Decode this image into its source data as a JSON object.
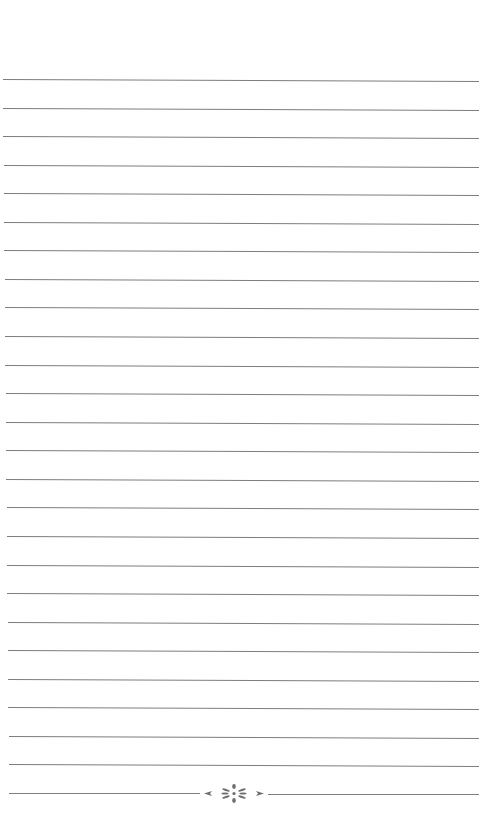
{
  "page": {
    "type": "lined-notebook-page",
    "background_color": "#ffffff",
    "line_color": "#7d7d7d",
    "line_count": 26,
    "first_line_y": 79,
    "line_spacing": 28.56,
    "line_left_top": 3,
    "line_left_bottom": 9,
    "line_right": 479,
    "ornament": {
      "icon": "flourish-divider-icon",
      "color": "#6e6e6e",
      "position": "bottom-center"
    }
  }
}
